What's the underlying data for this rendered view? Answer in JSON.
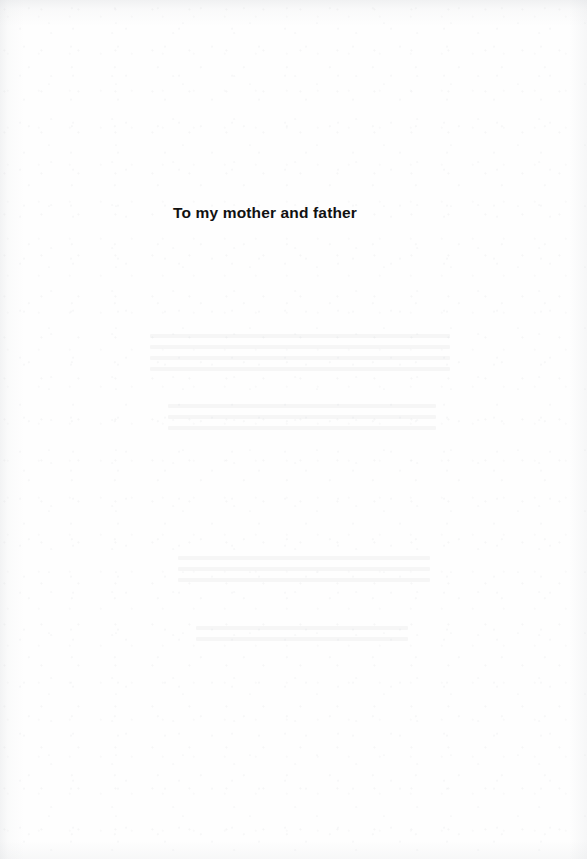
{
  "page": {
    "kind": "book-dedication-page",
    "background_color": "#fefefe",
    "width": 587,
    "height": 859
  },
  "dedication": {
    "text": "To my mother and father",
    "color": "#111111",
    "weight": "bold",
    "alignment": "left-of-center"
  },
  "artifacts": {
    "show_through_blocks": [
      {
        "lines": 4
      },
      {
        "lines": 3
      },
      {
        "lines": 3
      },
      {
        "lines": 2
      }
    ]
  }
}
